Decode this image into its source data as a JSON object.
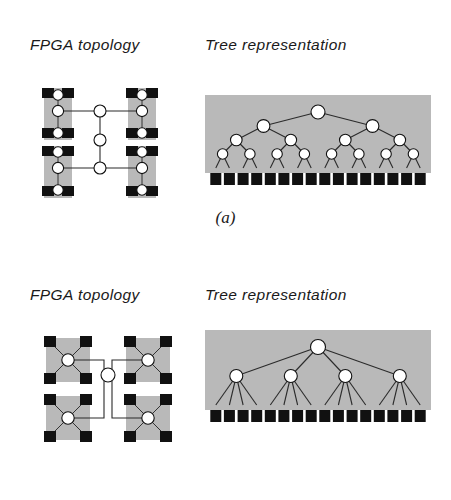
{
  "figure": {
    "panels": [
      {
        "id": "a",
        "caption": "(a)",
        "headings": {
          "left": "FPGA topology",
          "right": "Tree representation"
        },
        "fpga": {
          "kind": "hierarchical-mesh",
          "cluster_count": 4,
          "per_cluster": {
            "black_squares": 4,
            "white_circles": 3,
            "arrangement": "corners-and-column"
          },
          "routing_nodes": 3,
          "clusters": [
            {
              "x": 38,
              "y": 88
            },
            {
              "x": 122,
              "y": 88
            },
            {
              "x": 38,
              "y": 145
            },
            {
              "x": 122,
              "y": 145
            }
          ],
          "routers": [
            {
              "x": 100,
              "y": 111
            },
            {
              "x": 100,
              "y": 140
            },
            {
              "x": 100,
              "y": 168
            }
          ]
        },
        "tree": {
          "kind": "binary",
          "branching_factor": 2,
          "levels": 5,
          "level_node_counts": [
            1,
            2,
            4,
            8,
            16
          ],
          "leaf_count": 16,
          "leaf_shape": "black-square",
          "internal_shape": "white-circle",
          "panel_rect": {
            "x": 205,
            "y": 95,
            "w": 226,
            "h": 78
          }
        }
      },
      {
        "id": "b",
        "caption": "(b)",
        "headings": {
          "left": "FPGA topology",
          "right": "Tree representation"
        },
        "fpga": {
          "kind": "star-hub",
          "cluster_count": 4,
          "per_cluster": {
            "black_squares": 4,
            "white_circles": 1,
            "arrangement": "x-crossbar"
          },
          "routing_nodes": 1,
          "clusters": [
            {
              "x": 38,
              "y": 88
            },
            {
              "x": 122,
              "y": 88
            },
            {
              "x": 38,
              "y": 145
            },
            {
              "x": 122,
              "y": 145
            }
          ],
          "routers": [
            {
              "x": 100,
              "y": 125
            }
          ]
        },
        "tree": {
          "kind": "4-ary",
          "branching_factor": 4,
          "levels": 3,
          "level_node_counts": [
            1,
            4,
            16
          ],
          "leaf_count": 16,
          "leaf_shape": "black-square",
          "internal_shape": "white-circle",
          "panel_rect": {
            "x": 205,
            "y": 80,
            "w": 226,
            "h": 80
          }
        }
      }
    ]
  },
  "colors": {
    "background": "#ffffff",
    "panel_gray": "#b9b9b9",
    "node_stroke": "#111111",
    "node_fill": "#ffffff",
    "leaf_black": "#111111",
    "link": "#2b2b2b",
    "text": "#1a1a1a"
  }
}
